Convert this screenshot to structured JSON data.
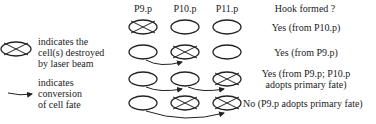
{
  "legend": {
    "destroyed": {
      "icon": "crossed-ellipse-icon",
      "lines": [
        "indicates the",
        "cell(s) destroyed",
        "by laser beam"
      ]
    },
    "conversion": {
      "icon": "curved-arrow-icon",
      "lines": [
        "indicates",
        "conversion",
        "of cell fate"
      ]
    }
  },
  "columns": [
    "P9.p",
    "P10.p",
    "P11.p"
  ],
  "result_header": "Hook formed ?",
  "rows": [
    {
      "destroyed": [
        "P9.p"
      ],
      "arrows": [],
      "result": [
        "Yes (from P10.p)"
      ]
    },
    {
      "destroyed": [
        "P10.p"
      ],
      "arrows": [
        [
          "P9.p",
          "P10.p"
        ]
      ],
      "result": [
        "Yes (from P9.p)"
      ]
    },
    {
      "destroyed": [
        "P11.p"
      ],
      "arrows": [
        [
          "P9.p",
          "P10.p"
        ],
        [
          "P10.p",
          "P11.p"
        ]
      ],
      "result": [
        "Yes (from P9.p; P10.p",
        "adopts primary fate)"
      ]
    },
    {
      "destroyed": [
        "P10.p",
        "P11.p"
      ],
      "arrows": [
        [
          "P9.p",
          "P11.p"
        ]
      ],
      "result": [
        "No (P9.p adopts primary fate)"
      ]
    }
  ]
}
